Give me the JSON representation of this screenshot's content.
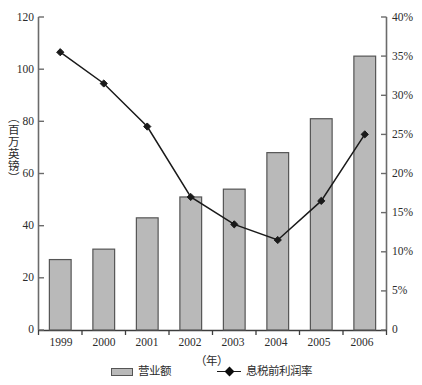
{
  "chart_data": {
    "type": "bar",
    "title": "",
    "subtitle": "",
    "xlabel": "（年）",
    "ylabel": "（百万英镑）",
    "y2label": "",
    "categories": [
      "1999",
      "2000",
      "2001",
      "2002",
      "2003",
      "2004",
      "2005",
      "2006"
    ],
    "ylim": [
      0,
      120
    ],
    "y2lim": [
      0,
      40
    ],
    "yticks": [
      "0",
      "20",
      "40",
      "60",
      "80",
      "100",
      "120"
    ],
    "y2ticks": [
      "0",
      "5%",
      "10%",
      "15%",
      "20%",
      "25%",
      "30%",
      "35%",
      "40%"
    ],
    "grid": false,
    "legend_position": "bottom",
    "series": [
      {
        "name": "营业额",
        "type": "bar",
        "axis": "left",
        "unit": "百万英镑",
        "values": [
          27,
          31,
          43,
          51,
          54,
          68,
          81,
          105
        ],
        "color": "#b9b9b9",
        "edge_color": "#555555"
      },
      {
        "name": "息税前利润率",
        "type": "line",
        "axis": "right",
        "unit": "%",
        "values": [
          35.5,
          31.5,
          26.0,
          17.0,
          13.5,
          11.5,
          16.5,
          25.0
        ],
        "color": "#1a1a1a",
        "marker": "diamond"
      }
    ]
  },
  "legend": {
    "bar_label": "营业额",
    "line_label": "息税前利润率"
  },
  "axes": {
    "left_axis_name": "left-value-axis",
    "right_axis_name": "right-percent-axis",
    "bottom_axis_name": "category-axis"
  }
}
